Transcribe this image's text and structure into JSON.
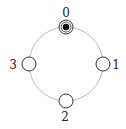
{
  "diagram": {
    "type": "ring",
    "ring": {
      "cx": 66,
      "cy": 64,
      "r": 37,
      "stroke": "#bdbdbd"
    },
    "nodes": [
      {
        "id": "0",
        "label": "0",
        "cx": 66,
        "cy": 27,
        "has_token": true
      },
      {
        "id": "1",
        "label": "1",
        "cx": 103,
        "cy": 64,
        "has_token": false
      },
      {
        "id": "2",
        "label": "2",
        "cx": 66,
        "cy": 101,
        "has_token": false
      },
      {
        "id": "3",
        "label": "3",
        "cx": 29,
        "cy": 64,
        "has_token": false
      }
    ],
    "colors": {
      "node_stroke": "#333333",
      "token": "#111111"
    }
  }
}
